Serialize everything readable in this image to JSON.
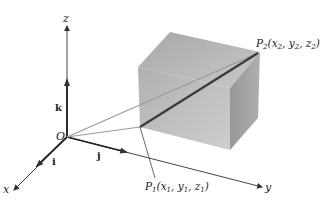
{
  "diagram": {
    "type": "3d-vector-geometry",
    "axes": {
      "x": {
        "label": "x"
      },
      "y": {
        "label": "y"
      },
      "z": {
        "label": "z"
      }
    },
    "unit_vectors": {
      "i": "i",
      "j": "j",
      "k": "k"
    },
    "origin": {
      "label": "O"
    },
    "points": {
      "p1": {
        "name": "P",
        "sub": "1",
        "coords_open": "(x",
        "c1": "1",
        "sep1": ", y",
        "c2": "1",
        "sep2": ", z",
        "c3": "1",
        "close": ")"
      },
      "p2": {
        "name": "P",
        "sub": "2",
        "coords_open": "(x",
        "c1": "2",
        "sep1": ", y",
        "c2": "2",
        "sep2": ", z",
        "c3": "2",
        "close": ")"
      }
    },
    "colors": {
      "axis": "#333333",
      "box_front": "#b4b4b4",
      "box_top": "#a9a9a9",
      "box_side": "#9c9c9c",
      "ray_light": "#9a9a9a",
      "segment": "#3a3a3a"
    }
  }
}
